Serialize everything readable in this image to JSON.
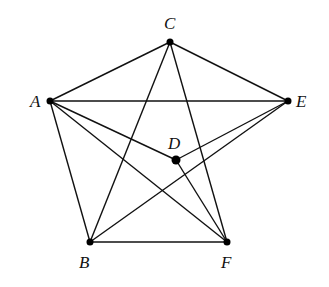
{
  "diagram": {
    "type": "graph",
    "nodes": [
      {
        "id": "A",
        "label": "A",
        "x": 50,
        "y": 101,
        "lx": 30,
        "ly": 107
      },
      {
        "id": "B",
        "label": "B",
        "x": 90,
        "y": 242,
        "lx": 79,
        "ly": 268
      },
      {
        "id": "C",
        "label": "C",
        "x": 170,
        "y": 42,
        "lx": 164,
        "ly": 29
      },
      {
        "id": "D",
        "label": "D",
        "x": 176,
        "y": 160,
        "lx": 168,
        "ly": 149
      },
      {
        "id": "E",
        "label": "E",
        "x": 288,
        "y": 101,
        "lx": 296,
        "ly": 107
      },
      {
        "id": "F",
        "label": "F",
        "x": 227,
        "y": 242,
        "lx": 221,
        "ly": 268
      }
    ],
    "edges": [
      [
        "A",
        "C"
      ],
      [
        "C",
        "E"
      ],
      [
        "A",
        "E"
      ],
      [
        "A",
        "D"
      ],
      [
        "A",
        "B"
      ],
      [
        "A",
        "F"
      ],
      [
        "C",
        "B"
      ],
      [
        "C",
        "F"
      ],
      [
        "D",
        "E"
      ],
      [
        "D",
        "F"
      ],
      [
        "E",
        "B"
      ],
      [
        "B",
        "F"
      ]
    ]
  }
}
